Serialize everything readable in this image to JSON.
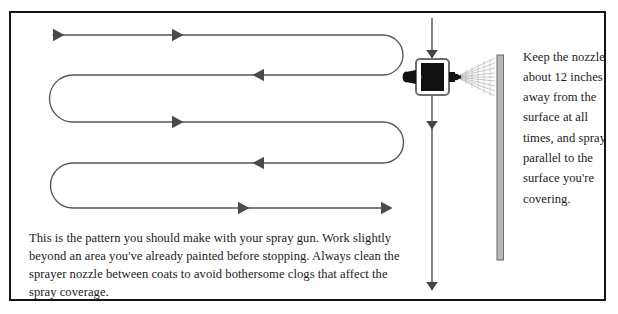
{
  "figure": {
    "frame": {
      "border_color": "#151515",
      "background": "#ffffff"
    }
  },
  "caption": {
    "text": "This is the pattern you should make with your spray gun. Work slightly beyond an area you've already painted before stopping. Always clean the sprayer nozzle between coats to avoid bothersome clogs that affect the spray coverage."
  },
  "side_note": {
    "text": "Keep the nozzle about 12 inches away from the surface at all times, and spray parallel to the surface you're covering."
  },
  "diagram": {
    "path_label": "serpentine-spray-path",
    "stroke_color": "#555555",
    "arrow_color": "#4a4a4a",
    "rows": [
      {
        "y": 35,
        "direction": "right"
      },
      {
        "y": 75,
        "direction": "left"
      },
      {
        "y": 122,
        "direction": "right"
      },
      {
        "y": 163,
        "direction": "left"
      },
      {
        "y": 208,
        "direction": "right"
      }
    ],
    "path_left_x": 53,
    "path_right_x": 383,
    "arrow_positions_right": [
      52,
      170
    ],
    "arrow_positions_left": [
      262
    ],
    "arrow_positions_final": [
      237,
      381
    ]
  },
  "spray_gun": {
    "label": "spray-gun",
    "body_color": "#111111",
    "outline_color": "#6e6e6e",
    "x": 432,
    "y": 77,
    "travel_arrow_label": "vertical-travel-arrow",
    "travel_line_color": "#444444",
    "travel_top_y": 18,
    "travel_bottom_y": 290,
    "arrowhead_ys": [
      55,
      128,
      285
    ]
  },
  "spray_fan": {
    "label": "spray-fan",
    "color": "#8d8d8d",
    "origin_x": 455,
    "origin_y": 77,
    "target_x": 495,
    "spread_px": 26
  },
  "surface": {
    "label": "wall-surface",
    "fill_color": "#b9b9b9",
    "edge_color": "#6b6b6b",
    "x": 497,
    "top_y": 55,
    "bottom_y": 260,
    "width": 6
  }
}
